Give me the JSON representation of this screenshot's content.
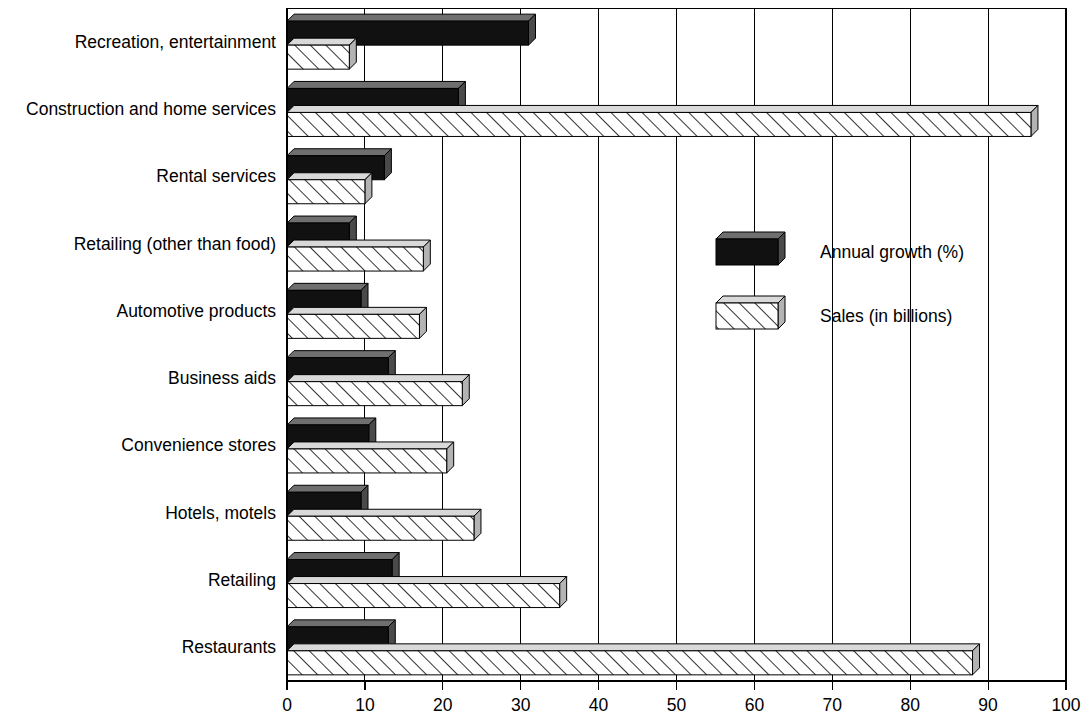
{
  "chart_data": {
    "type": "bar",
    "orientation": "horizontal",
    "title": "",
    "subtitle": "",
    "xlabel": "",
    "ylabel": "",
    "xlim": [
      0,
      100
    ],
    "xticks": [
      "0",
      "10",
      "20",
      "30",
      "40",
      "50",
      "60",
      "70",
      "80",
      "90",
      "100"
    ],
    "grid": true,
    "legend_position": "inside-right-upper",
    "categories": [
      "Recreation, entertainment",
      "Construction and home services",
      "Rental services",
      "Retailing (other than food)",
      "Automotive products",
      "Business aids",
      "Convenience stores",
      "Hotels, motels",
      "Retailing",
      "Restaurants"
    ],
    "series": [
      {
        "name": "Annual growth (%)",
        "style": "solid-black",
        "color": "#111111",
        "values": [
          31,
          22,
          12.5,
          8,
          9.5,
          13,
          10.5,
          9.5,
          13.5,
          13
        ]
      },
      {
        "name": "Sales (in billions)",
        "style": "diagonal-hatch",
        "color": "#ffffff",
        "values": [
          8,
          95.5,
          10,
          17.5,
          17,
          22.5,
          20.5,
          24,
          35,
          88
        ]
      }
    ]
  },
  "legend": {
    "items": [
      {
        "label": "Annual growth (%)",
        "swatch": "solid-black-swatch"
      },
      {
        "label": "Sales (in billions)",
        "swatch": "hatched-swatch"
      }
    ]
  },
  "colors": {
    "background": "#ffffff",
    "ink": "#000000",
    "bar_dark": "#111111",
    "bar_dark_top": "#6f6f6f",
    "bar_hatch_fill": "#ffffff",
    "grid": "#000000"
  }
}
